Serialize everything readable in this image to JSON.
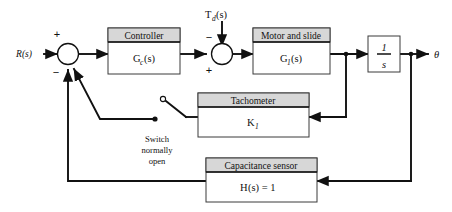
{
  "diagram": {
    "colors": {
      "line": "#111111",
      "block_border": "#3a3a3a",
      "block_header_fill": "#d7d7d7",
      "block_body_fill": "#ffffff",
      "background": "#ffffff"
    }
  },
  "signals": {
    "input": "R(s)",
    "disturbance_main": "T",
    "disturbance_sub": "d",
    "disturbance_tail": "(s)",
    "output": "θ"
  },
  "summing_junctions": [
    {
      "name": "input-error-junction",
      "sign_top": "+",
      "sign_bottom": "−"
    },
    {
      "name": "disturbance-junction",
      "sign_top": "−",
      "sign_bottom": "+"
    }
  ],
  "blocks": [
    {
      "name": "controller",
      "header": "Controller",
      "body_main": "G",
      "body_sub": "c",
      "body_tail": "(s)"
    },
    {
      "name": "motor-and-slide",
      "header": "Motor and slide",
      "body_main": "G",
      "body_sub": "1",
      "body_tail": "(s)"
    },
    {
      "name": "integrator",
      "numerator": "1",
      "denominator": "s"
    },
    {
      "name": "tachometer",
      "header": "Tachometer",
      "body_main": "K",
      "body_sub": "1",
      "body_tail": ""
    },
    {
      "name": "capacitance-sensor",
      "header": "Capacitance sensor",
      "body_main": "H",
      "body_tail": "(s) = 1"
    }
  ],
  "annotations": {
    "switch_line1": "Switch",
    "switch_line2": "normally",
    "switch_line3": "open"
  }
}
